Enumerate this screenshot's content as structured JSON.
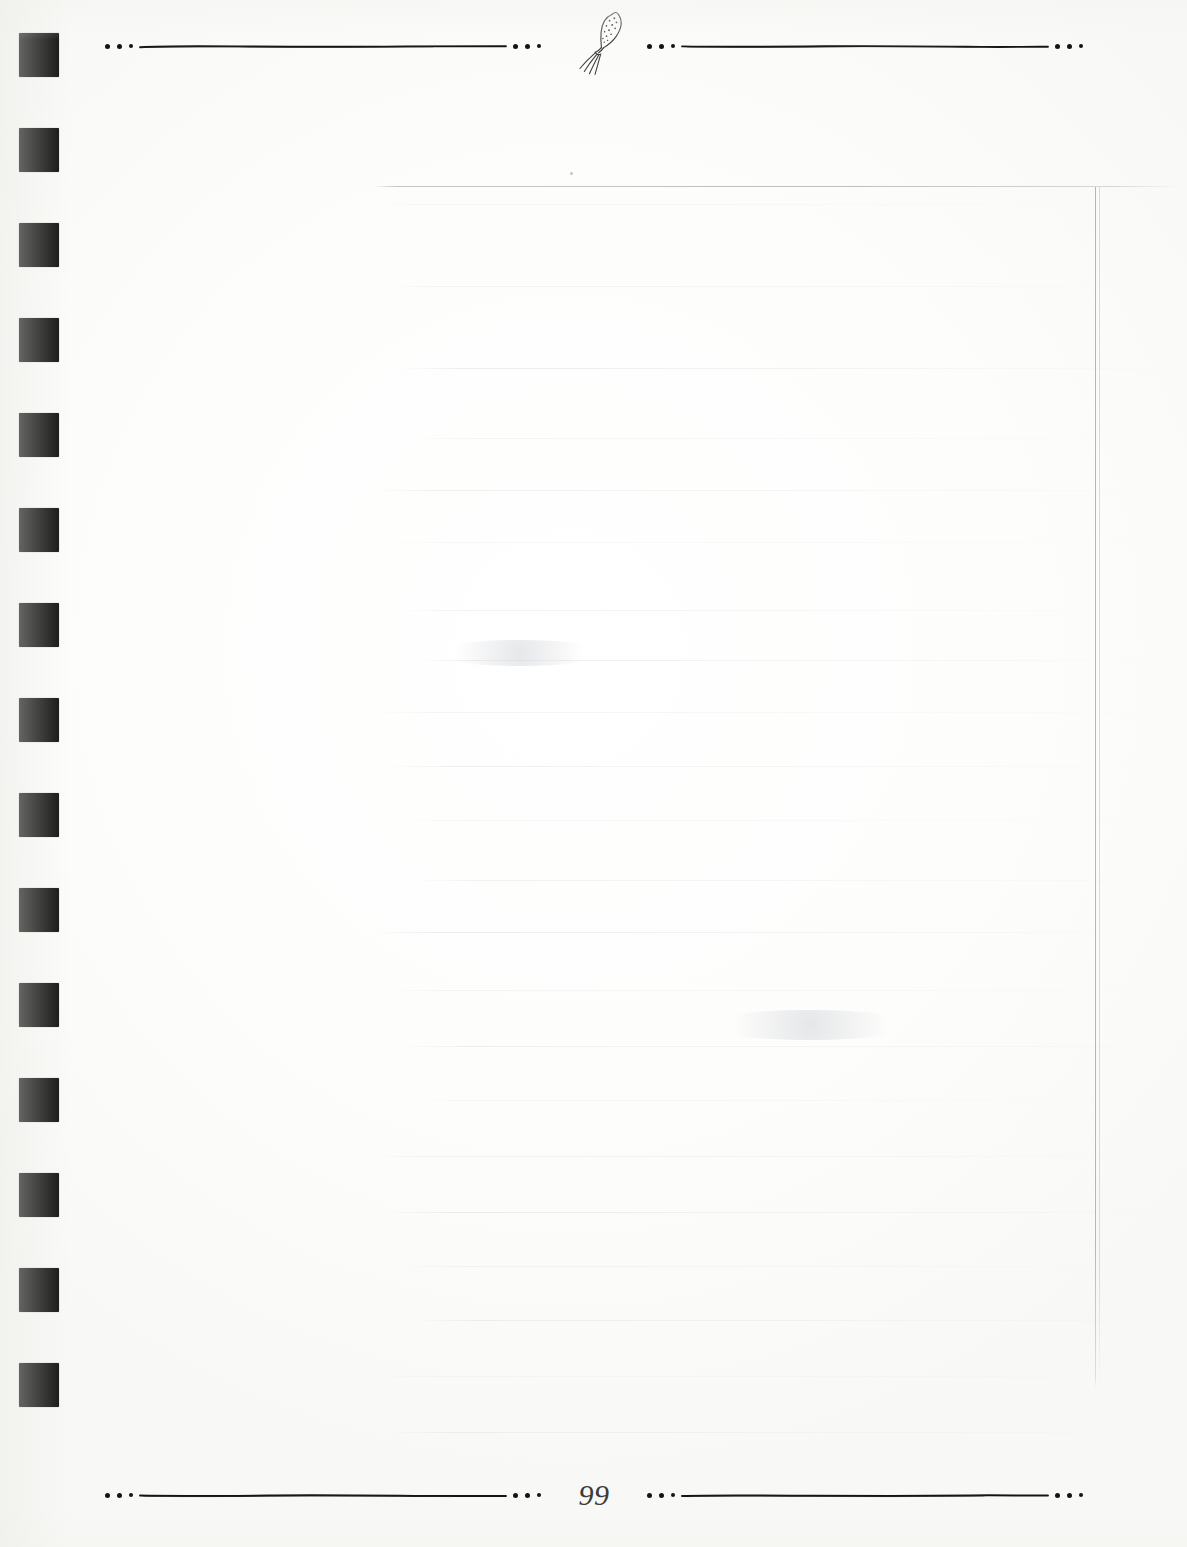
{
  "page": {
    "number": "99",
    "background_color": "#fcfcfb",
    "ink_color": "#141414",
    "width": 1187,
    "height": 1547
  },
  "top_border": {
    "name": "decorative-top-rule",
    "ornament": "fork-icon",
    "ornament_label": "fork",
    "dot_clusters": 4,
    "rule_segments": 2
  },
  "bottom_border": {
    "name": "decorative-bottom-rule",
    "center_label": "99",
    "dot_clusters": 4,
    "rule_segments": 2
  },
  "binding": {
    "name": "punch-hole-column",
    "square_count": 15,
    "square_color": "#0a0a0a",
    "first_square_top": 33,
    "square_spacing": 95,
    "square_width": 40,
    "square_height": 44,
    "square_left": 19
  },
  "content_frame": {
    "name": "faint-content-frame",
    "visible_rules": [
      "horizontal-top",
      "vertical-right"
    ],
    "horizontal_top": {
      "left": 373,
      "top": 186,
      "width": 807
    },
    "vertical_right": {
      "left": 1095,
      "top": 187,
      "height": 1201
    },
    "text": ""
  },
  "ghost_content": {
    "description": "faint show-through ruled lines from reverse of page",
    "line_tops": [
      14,
      96,
      178,
      248,
      300,
      352,
      420,
      470,
      522,
      576,
      630,
      690,
      742,
      800,
      856,
      910,
      966,
      1022,
      1076,
      1130,
      1186,
      1242
    ],
    "speck": {
      "left": 196,
      "top": -18
    }
  }
}
